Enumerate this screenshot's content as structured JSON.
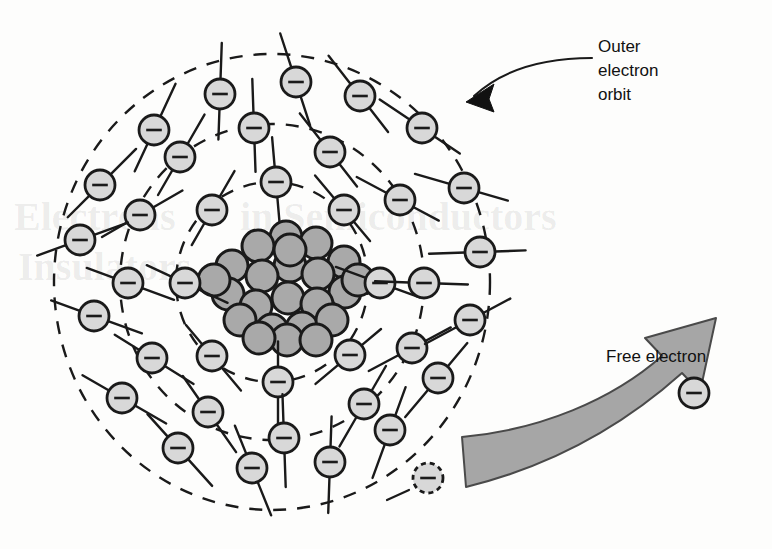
{
  "figure": {
    "kind": "atomic-structure-diagram",
    "background_color": "#fdfdfc"
  },
  "labels": {
    "outer_orbit": {
      "name": "outer-electron-orbit-label",
      "lines": [
        "Outer",
        "electron",
        "orbit"
      ],
      "color": "#111111",
      "x": 598,
      "y": 52
    },
    "free_electron": {
      "name": "free-electron-label",
      "text": "Free electron",
      "color": "#111111",
      "x": 606,
      "y": 362
    }
  },
  "nucleus": {
    "name": "nucleus",
    "center": [
      286,
      283
    ],
    "particle_fill": "#a9a9a9",
    "particle_stroke": "#1a1a1a",
    "particle_radius": 16,
    "particles": [
      [
        286,
        237
      ],
      [
        316,
        243
      ],
      [
        258,
        246
      ],
      [
        344,
        262
      ],
      [
        290,
        266
      ],
      [
        232,
        266
      ],
      [
        262,
        276
      ],
      [
        318,
        274
      ],
      [
        345,
        292
      ],
      [
        228,
        294
      ],
      [
        256,
        306
      ],
      [
        288,
        298
      ],
      [
        317,
        304
      ],
      [
        240,
        320
      ],
      [
        272,
        330
      ],
      [
        302,
        328
      ],
      [
        332,
        320
      ],
      [
        290,
        250
      ],
      [
        214,
        280
      ],
      [
        358,
        280
      ],
      [
        287,
        340
      ],
      [
        259,
        338
      ],
      [
        316,
        340
      ]
    ]
  },
  "orbits": {
    "name": "electron-orbits",
    "center": [
      272,
      282
    ],
    "dash_pattern": "13 11",
    "stroke": "#1a1a1a",
    "stroke_width": 2.4,
    "rings": [
      {
        "name": "inner-orbit",
        "rx": 96,
        "ry": 100,
        "electron_count": 8
      },
      {
        "name": "middle-orbit",
        "rx": 152,
        "ry": 158,
        "electron_count": 12
      },
      {
        "name": "outer-orbit",
        "rx": 218,
        "ry": 228,
        "electron_count": 16
      }
    ]
  },
  "electrons": {
    "name": "electron",
    "symbol": "minus",
    "fill": "#d8d8d8",
    "stroke": "#1a1a1a",
    "radius": 15,
    "bound": [
      {
        "ring": "inner-orbit",
        "cx": 185,
        "cy": 283,
        "tail": 32,
        "tail_angle": 25
      },
      {
        "ring": "inner-orbit",
        "cx": 212,
        "cy": 210,
        "tail": 30,
        "tail_angle": 300
      },
      {
        "ring": "inner-orbit",
        "cx": 276,
        "cy": 182,
        "tail": 30,
        "tail_angle": 265
      },
      {
        "ring": "inner-orbit",
        "cx": 344,
        "cy": 210,
        "tail": 30,
        "tail_angle": 230
      },
      {
        "ring": "inner-orbit",
        "cx": 380,
        "cy": 283,
        "tail": 32,
        "tail_angle": 200
      },
      {
        "ring": "inner-orbit",
        "cx": 350,
        "cy": 355,
        "tail": 30,
        "tail_angle": 140
      },
      {
        "ring": "inner-orbit",
        "cx": 278,
        "cy": 382,
        "tail": 30,
        "tail_angle": 90
      },
      {
        "ring": "inner-orbit",
        "cx": 212,
        "cy": 356,
        "tail": 30,
        "tail_angle": 50
      },
      {
        "ring": "middle-orbit",
        "cx": 128,
        "cy": 283,
        "tail": 34,
        "tail_angle": 20
      },
      {
        "ring": "middle-orbit",
        "cx": 140,
        "cy": 215,
        "tail": 34,
        "tail_angle": 330
      },
      {
        "ring": "middle-orbit",
        "cx": 180,
        "cy": 157,
        "tail": 34,
        "tail_angle": 300
      },
      {
        "ring": "middle-orbit",
        "cx": 254,
        "cy": 128,
        "tail": 34,
        "tail_angle": 268
      },
      {
        "ring": "middle-orbit",
        "cx": 330,
        "cy": 152,
        "tail": 34,
        "tail_angle": 232
      },
      {
        "ring": "middle-orbit",
        "cx": 400,
        "cy": 200,
        "tail": 34,
        "tail_angle": 208
      },
      {
        "ring": "middle-orbit",
        "cx": 424,
        "cy": 283,
        "tail": 34,
        "tail_angle": 182
      },
      {
        "ring": "middle-orbit",
        "cx": 412,
        "cy": 348,
        "tail": 34,
        "tail_angle": 152
      },
      {
        "ring": "middle-orbit",
        "cx": 364,
        "cy": 404,
        "tail": 34,
        "tail_angle": 120
      },
      {
        "ring": "middle-orbit",
        "cx": 284,
        "cy": 438,
        "tail": 34,
        "tail_angle": 88
      },
      {
        "ring": "middle-orbit",
        "cx": 208,
        "cy": 412,
        "tail": 34,
        "tail_angle": 55
      },
      {
        "ring": "middle-orbit",
        "cx": 152,
        "cy": 358,
        "tail": 34,
        "tail_angle": 32
      },
      {
        "ring": "outer-orbit",
        "cx": 80,
        "cy": 240,
        "tail": 36,
        "tail_angle": 340
      },
      {
        "ring": "outer-orbit",
        "cx": 94,
        "cy": 316,
        "tail": 36,
        "tail_angle": 20
      },
      {
        "ring": "outer-orbit",
        "cx": 100,
        "cy": 185,
        "tail": 36,
        "tail_angle": 315
      },
      {
        "ring": "outer-orbit",
        "cx": 154,
        "cy": 130,
        "tail": 36,
        "tail_angle": 295
      },
      {
        "ring": "outer-orbit",
        "cx": 220,
        "cy": 94,
        "tail": 36,
        "tail_angle": 272
      },
      {
        "ring": "outer-orbit",
        "cx": 296,
        "cy": 82,
        "tail": 36,
        "tail_angle": 252
      },
      {
        "ring": "outer-orbit",
        "cx": 360,
        "cy": 96,
        "tail": 36,
        "tail_angle": 232
      },
      {
        "ring": "outer-orbit",
        "cx": 422,
        "cy": 128,
        "tail": 36,
        "tail_angle": 214
      },
      {
        "ring": "outer-orbit",
        "cx": 464,
        "cy": 188,
        "tail": 36,
        "tail_angle": 196
      },
      {
        "ring": "outer-orbit",
        "cx": 480,
        "cy": 252,
        "tail": 36,
        "tail_angle": 178
      },
      {
        "ring": "outer-orbit",
        "cx": 470,
        "cy": 320,
        "tail": 36,
        "tail_angle": 152
      },
      {
        "ring": "outer-orbit",
        "cx": 438,
        "cy": 378,
        "tail": 36,
        "tail_angle": 130
      },
      {
        "ring": "outer-orbit",
        "cx": 390,
        "cy": 430,
        "tail": 36,
        "tail_angle": 110
      },
      {
        "ring": "outer-orbit",
        "cx": 330,
        "cy": 462,
        "tail": 36,
        "tail_angle": 92
      },
      {
        "ring": "outer-orbit",
        "cx": 252,
        "cy": 468,
        "tail": 36,
        "tail_angle": 68
      },
      {
        "ring": "outer-orbit",
        "cx": 178,
        "cy": 448,
        "tail": 36,
        "tail_angle": 48
      },
      {
        "ring": "outer-orbit",
        "cx": 122,
        "cy": 398,
        "tail": 36,
        "tail_angle": 30
      }
    ],
    "escaping": {
      "name": "escaping-electron",
      "cx": 428,
      "cy": 478,
      "dashed_outline": true,
      "dash_pattern": "5 4"
    },
    "free": {
      "name": "free-electron",
      "cx": 694,
      "cy": 393,
      "radius": 15
    }
  },
  "arrow": {
    "name": "free-electron-arrow",
    "fill": "#a6a6a6",
    "stroke": "#4a4a4a",
    "stroke_width": 2,
    "description": "thick curved banner arrow sweeping from lower-left to upper-right"
  },
  "leader": {
    "name": "outer-orbit-leader-line",
    "stroke": "#1a1a1a",
    "stroke_width": 2,
    "arrowhead_at": [
      470,
      98
    ],
    "text_anchor_at": [
      592,
      58
    ]
  },
  "ghost_text": {
    "name": "background-bleedthrough-text",
    "visible": true,
    "items": [
      {
        "text": "Electrons",
        "x": 14,
        "y": 230,
        "size": 40,
        "opacity": 0.08
      },
      {
        "text": "in Semiconductors",
        "x": 240,
        "y": 230,
        "size": 40,
        "opacity": 0.07
      },
      {
        "text": "Insulators",
        "x": 18,
        "y": 280,
        "size": 40,
        "opacity": 0.08
      }
    ]
  }
}
